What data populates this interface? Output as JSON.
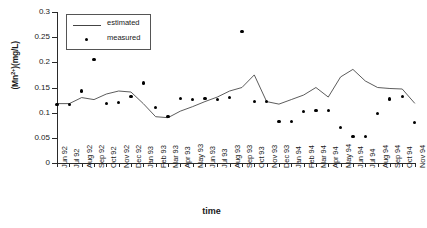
{
  "chart_data": {
    "type": "line",
    "title": "",
    "xlabel": "time",
    "ylabel": "(Mn2+)(mg/L)",
    "ylabel_base": "(Mn",
    "ylabel_sup": "2+",
    "ylabel_tail": ")(mg/L)",
    "ylim": [
      0,
      0.3
    ],
    "ytick_labels": [
      "0.3",
      "0.25",
      "0.2",
      "0.15",
      "0.1",
      "0.05",
      "0"
    ],
    "ytick_values": [
      0.3,
      0.25,
      0.2,
      0.15,
      0.1,
      0.05,
      0
    ],
    "grid": false,
    "legend_position": "top-left",
    "categories": [
      "Jun 92",
      "Jul 92",
      "Aug 92",
      "Sep 92",
      "Oct 92",
      "Nov 92",
      "Dec 92",
      "Jan 93",
      "Feb 93",
      "Mar 93",
      "Apr 93",
      "May 93",
      "Jun 93",
      "Jul 93",
      "Aug 93",
      "Sep 93",
      "Oct 93",
      "Nov 93",
      "Dec 93",
      "Jan 94",
      "Feb 94",
      "Mar 94",
      "Apr 94",
      "May 94",
      "Jun 94",
      "Jul 94",
      "Aug 94",
      "Sep 94",
      "Oct 94",
      "Nov 94"
    ],
    "series": [
      {
        "name": "estimated",
        "type": "line",
        "values": [
          0.118,
          0.118,
          0.13,
          0.126,
          0.137,
          0.143,
          0.141,
          0.118,
          0.092,
          0.09,
          0.103,
          0.112,
          0.122,
          0.131,
          0.143,
          0.15,
          0.175,
          0.122,
          0.117,
          0.126,
          0.135,
          0.15,
          0.131,
          0.171,
          0.186,
          0.163,
          0.15,
          0.148,
          0.147,
          0.119
        ]
      },
      {
        "name": "measured",
        "type": "scatter",
        "values": [
          0.116,
          0.116,
          0.143,
          0.205,
          0.118,
          0.12,
          0.132,
          0.159,
          0.11,
          0.092,
          0.128,
          0.126,
          0.128,
          0.126,
          0.13,
          0.262,
          0.122,
          0.122,
          0.082,
          0.083,
          0.102,
          0.105,
          0.104,
          0.07,
          0.053,
          0.053,
          0.098,
          0.127,
          0.132,
          0.08
        ]
      }
    ],
    "legend": [
      {
        "label": "estimated",
        "marker": "line"
      },
      {
        "label": "measured",
        "marker": "dot"
      }
    ]
  }
}
